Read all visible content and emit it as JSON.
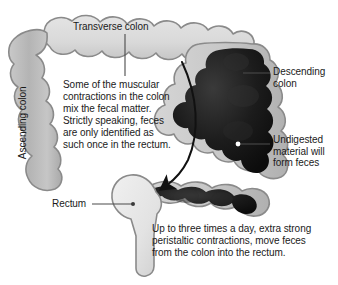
{
  "diagram": {
    "background_color": "#ffffff",
    "text_color": "#1a1a1a",
    "colors": {
      "colon_light_fill": "#d8d8d8",
      "colon_mid_fill": "#bdbdbd",
      "colon_outline": "#8a8a8a",
      "fecal_mass_dark": "#161616",
      "leader_line": "#4a4a4a",
      "arrow": "#111111",
      "marker_dot": "#ffffff"
    }
  },
  "labels": {
    "transverse_colon": "Transverse colon",
    "ascending_colon": "Ascending colon",
    "descending_colon": "Descending\ncolon",
    "undigested_material": "Undigested\nmaterial will\nform feces",
    "rectum": "Rectum"
  },
  "notes": {
    "mixing": "Some of the muscular\ncontractions in the colon\nmix the fecal matter.\nStrictly speaking, feces\nare only identified as\nsuch once in the rectum.",
    "peristalsis": "Up to three times a day, extra strong\nperistaltic contractions, move feces\nfrom the colon into the rectum."
  },
  "annotations": {
    "leader_lines": [
      {
        "name": "transverse-colon-leader",
        "from": [
          125,
          34
        ],
        "to": [
          125,
          76
        ]
      },
      {
        "name": "descending-colon-leader",
        "from": [
          243,
          73
        ],
        "to": [
          270,
          73
        ]
      },
      {
        "name": "undigested-leader",
        "from": [
          238,
          144
        ],
        "to": [
          270,
          144
        ]
      },
      {
        "name": "rectum-leader",
        "from": [
          92,
          204
        ],
        "to": [
          133,
          204
        ]
      }
    ],
    "flow_arrow": {
      "name": "peristalsis-flow-arrow",
      "description": "Long curved arrow sweeping from upper transverse colon down and left toward the sigmoid colon",
      "head_direction": "down-left"
    },
    "marker_dots": [
      {
        "name": "undigested-marker-dot",
        "at": [
          238,
          144
        ]
      },
      {
        "name": "rectum-marker-dot",
        "at": [
          133,
          204
        ]
      }
    ]
  }
}
